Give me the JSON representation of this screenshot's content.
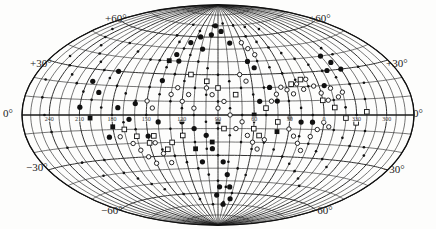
{
  "chart_data": {
    "type": "scatter",
    "projection": "Hammer-Aitoff equal-area all-sky",
    "title": "",
    "grid": {
      "on": true,
      "meridian_step_deg": 10,
      "parallel_step_deg": 10
    },
    "latitude_labels": {
      "left": [
        "+60°",
        "+30°",
        "0°",
        "−30°",
        "−60°"
      ],
      "right": [
        "+60°",
        "+30°",
        "0°",
        "−30°",
        "−60°"
      ]
    },
    "longitude_labels": [
      "240",
      "210",
      "180",
      "150",
      "120",
      "90",
      "60",
      "30",
      "0",
      "330",
      "300"
    ],
    "longitude_label_values": [
      240,
      210,
      180,
      150,
      120,
      90,
      60,
      30,
      0,
      330,
      300
    ],
    "center_longitude": 90,
    "marker_types": [
      "small filled dot",
      "large filled dot",
      "open circle",
      "open square",
      "filled square"
    ],
    "series": [
      {
        "name": "small filled dots",
        "marker": "dot-small",
        "points": [
          [
            250,
            55
          ],
          [
            240,
            50
          ],
          [
            230,
            45
          ],
          [
            220,
            40
          ],
          [
            210,
            35
          ],
          [
            200,
            30
          ],
          [
            190,
            25
          ],
          [
            180,
            20
          ],
          [
            170,
            15
          ],
          [
            160,
            10
          ],
          [
            250,
            35
          ],
          [
            240,
            30
          ],
          [
            230,
            25
          ],
          [
            220,
            20
          ],
          [
            210,
            15
          ],
          [
            200,
            10
          ],
          [
            190,
            5
          ],
          [
            180,
            0
          ],
          [
            170,
            -5
          ],
          [
            160,
            -10
          ],
          [
            150,
            60
          ],
          [
            140,
            55
          ],
          [
            130,
            50
          ],
          [
            120,
            45
          ],
          [
            110,
            40
          ],
          [
            100,
            35
          ],
          [
            90,
            30
          ],
          [
            80,
            25
          ],
          [
            70,
            20
          ],
          [
            60,
            15
          ],
          [
            150,
            40
          ],
          [
            140,
            35
          ],
          [
            130,
            30
          ],
          [
            120,
            25
          ],
          [
            110,
            20
          ],
          [
            100,
            15
          ],
          [
            90,
            10
          ],
          [
            80,
            5
          ],
          [
            70,
            0
          ],
          [
            60,
            -5
          ],
          [
            150,
            20
          ],
          [
            140,
            15
          ],
          [
            130,
            10
          ],
          [
            120,
            5
          ],
          [
            110,
            0
          ],
          [
            100,
            -5
          ],
          [
            90,
            -10
          ],
          [
            80,
            -15
          ],
          [
            70,
            -20
          ],
          [
            60,
            -25
          ],
          [
            150,
            0
          ],
          [
            140,
            -5
          ],
          [
            130,
            -10
          ],
          [
            120,
            -15
          ],
          [
            110,
            -20
          ],
          [
            100,
            -25
          ],
          [
            90,
            -30
          ],
          [
            80,
            -35
          ],
          [
            70,
            -40
          ],
          [
            60,
            -45
          ],
          [
            150,
            -20
          ],
          [
            140,
            -25
          ],
          [
            130,
            -30
          ],
          [
            120,
            -35
          ],
          [
            110,
            -40
          ],
          [
            100,
            -45
          ],
          [
            90,
            -50
          ],
          [
            80,
            -55
          ],
          [
            70,
            -60
          ],
          [
            50,
            60
          ],
          [
            40,
            55
          ],
          [
            30,
            50
          ],
          [
            20,
            45
          ],
          [
            10,
            40
          ],
          [
            0,
            35
          ],
          [
            -10,
            30
          ],
          [
            -20,
            25
          ],
          [
            -30,
            20
          ],
          [
            50,
            40
          ],
          [
            40,
            35
          ],
          [
            30,
            30
          ],
          [
            20,
            25
          ],
          [
            10,
            20
          ],
          [
            0,
            15
          ],
          [
            -10,
            10
          ],
          [
            -20,
            5
          ],
          [
            -30,
            0
          ],
          [
            50,
            20
          ],
          [
            40,
            15
          ],
          [
            30,
            10
          ],
          [
            20,
            5
          ],
          [
            10,
            0
          ],
          [
            0,
            -5
          ],
          [
            -10,
            -10
          ],
          [
            -20,
            -15
          ],
          [
            -30,
            -20
          ],
          [
            50,
            0
          ],
          [
            40,
            -5
          ],
          [
            30,
            -10
          ],
          [
            20,
            -15
          ],
          [
            10,
            -20
          ],
          [
            0,
            -25
          ],
          [
            -10,
            -30
          ],
          [
            -20,
            -35
          ],
          [
            50,
            -20
          ],
          [
            40,
            -25
          ],
          [
            30,
            -30
          ],
          [
            20,
            -35
          ],
          [
            10,
            -40
          ],
          [
            0,
            -45
          ],
          [
            -10,
            -50
          ],
          [
            200,
            50
          ],
          [
            180,
            45
          ],
          [
            160,
            40
          ],
          [
            140,
            70
          ],
          [
            120,
            65
          ],
          [
            100,
            70
          ],
          [
            80,
            72
          ],
          [
            60,
            70
          ],
          [
            40,
            68
          ],
          [
            20,
            65
          ],
          [
            200,
            -30
          ],
          [
            190,
            -40
          ],
          [
            180,
            -45
          ],
          [
            170,
            -50
          ],
          [
            160,
            -55
          ],
          [
            140,
            -60
          ],
          [
            120,
            -65
          ],
          [
            100,
            -70
          ],
          [
            80,
            -68
          ],
          [
            230,
            -20
          ],
          [
            225,
            -30
          ],
          [
            215,
            -40
          ],
          [
            240,
            -10
          ],
          [
            245,
            0
          ],
          [
            250,
            10
          ],
          [
            255,
            20
          ],
          [
            -40,
            10
          ],
          [
            -45,
            20
          ],
          [
            -50,
            30
          ],
          [
            -40,
            -10
          ],
          [
            -45,
            -20
          ],
          [
            -50,
            -25
          ],
          [
            -35,
            40
          ],
          [
            -30,
            45
          ]
        ]
      },
      {
        "name": "large filled dots",
        "marker": "dot-large",
        "points": [
          [
            205,
            22
          ],
          [
            195,
            15
          ],
          [
            210,
            5
          ],
          [
            185,
            30
          ],
          [
            175,
            5
          ],
          [
            165,
            -3
          ],
          [
            160,
            8
          ],
          [
            140,
            25
          ],
          [
            135,
            45
          ],
          [
            125,
            55
          ],
          [
            115,
            60
          ],
          [
            108,
            50
          ],
          [
            100,
            62
          ],
          [
            95,
            70
          ],
          [
            85,
            65
          ],
          [
            75,
            55
          ],
          [
            60,
            40
          ],
          [
            55,
            35
          ],
          [
            45,
            20
          ],
          [
            40,
            10
          ],
          [
            100,
            -15
          ],
          [
            95,
            -25
          ],
          [
            85,
            -35
          ],
          [
            80,
            -45
          ],
          [
            75,
            -55
          ],
          [
            70,
            -65
          ],
          [
            110,
            -10
          ],
          [
            120,
            -5
          ],
          [
            105,
            -35
          ],
          [
            -20,
            40
          ],
          [
            -25,
            35
          ],
          [
            -30,
            30
          ],
          [
            10,
            -5
          ],
          [
            20,
            -5
          ],
          [
            30,
            -2
          ],
          [
            140,
            -5
          ],
          [
            150,
            -15
          ],
          [
            185,
            -15
          ],
          [
            88,
            -55
          ],
          [
            92,
            -62
          ],
          [
            80,
            -70
          ],
          [
            130,
            40
          ],
          [
            55,
            10
          ],
          [
            -5,
            20
          ],
          [
            -15,
            30
          ]
        ]
      },
      {
        "name": "open circles",
        "marker": "circle-open",
        "points": [
          [
            175,
            -15
          ],
          [
            165,
            -20
          ],
          [
            160,
            -25
          ],
          [
            155,
            -30
          ],
          [
            150,
            -35
          ],
          [
            145,
            -20
          ],
          [
            140,
            -28
          ],
          [
            135,
            -35
          ],
          [
            150,
            10
          ],
          [
            145,
            5
          ],
          [
            130,
            15
          ],
          [
            125,
            20
          ],
          [
            120,
            10
          ],
          [
            115,
            15
          ],
          [
            110,
            5
          ],
          [
            100,
            20
          ],
          [
            95,
            15
          ],
          [
            90,
            5
          ],
          [
            85,
            10
          ],
          [
            80,
            0
          ],
          [
            75,
            -10
          ],
          [
            70,
            -5
          ],
          [
            65,
            -15
          ],
          [
            60,
            -20
          ],
          [
            55,
            -25
          ],
          [
            50,
            -18
          ],
          [
            45,
            10
          ],
          [
            40,
            15
          ],
          [
            35,
            20
          ],
          [
            30,
            18
          ],
          [
            25,
            15
          ],
          [
            20,
            22
          ],
          [
            15,
            18
          ],
          [
            10,
            25
          ],
          [
            5,
            20
          ],
          [
            0,
            15
          ],
          [
            -5,
            10
          ],
          [
            -10,
            18
          ],
          [
            -15,
            12
          ],
          [
            -20,
            15
          ],
          [
            30,
            -10
          ],
          [
            25,
            -15
          ],
          [
            20,
            -20
          ],
          [
            15,
            -25
          ],
          [
            10,
            -15
          ],
          [
            5,
            -10
          ],
          [
            0,
            -5
          ],
          [
            -5,
            -8
          ],
          [
            60,
            55
          ],
          [
            55,
            50
          ],
          [
            50,
            45
          ],
          [
            70,
            30
          ],
          [
            65,
            25
          ]
        ]
      },
      {
        "name": "open squares",
        "marker": "square-open",
        "points": [
          [
            170,
            -10
          ],
          [
            160,
            -15
          ],
          [
            150,
            -20
          ],
          [
            145,
            -15
          ],
          [
            135,
            -25
          ],
          [
            115,
            30
          ],
          [
            100,
            25
          ],
          [
            90,
            20
          ],
          [
            75,
            15
          ],
          [
            50,
            5
          ],
          [
            40,
            -5
          ],
          [
            25,
            22
          ],
          [
            15,
            25
          ],
          [
            0,
            10
          ],
          [
            -10,
            5
          ],
          [
            -20,
            -2
          ],
          [
            -30,
            -5
          ],
          [
            -40,
            2
          ],
          [
            85,
            -10
          ],
          [
            120,
            -15
          ],
          [
            130,
            -20
          ],
          [
            60,
            -10
          ],
          [
            55,
            -15
          ]
        ]
      },
      {
        "name": "filled squares",
        "marker": "square-filled",
        "points": [
          [
            200,
            -2
          ],
          [
            180,
            -8
          ],
          [
            90,
            -5
          ],
          [
            95,
            -20
          ],
          [
            60,
            0
          ],
          [
            40,
            -12
          ],
          [
            140,
            40
          ],
          [
            110,
            -25
          ]
        ]
      }
    ]
  }
}
